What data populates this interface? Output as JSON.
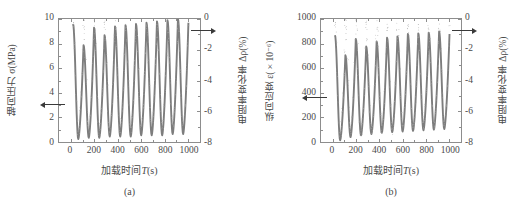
{
  "figure": {
    "panels": [
      {
        "id": "a",
        "panel_label": "(a)",
        "xtitle_cn": "加载时间",
        "xtitle_sym": "T",
        "xtitle_unit": "(s)",
        "ytitle_left": "轴向压力 σ(MPa)",
        "ytitle_right": "电阻率变化率 Δρ(%)",
        "xticks": [
          "0",
          "200",
          "400",
          "600",
          "800",
          "1000"
        ],
        "yticks_left": [
          "10",
          "8",
          "6",
          "4",
          "2",
          "0"
        ],
        "yticks_right": [
          "0",
          "-2",
          "-4",
          "-6",
          "-8"
        ]
      },
      {
        "id": "b",
        "panel_label": "(b)",
        "xtitle_cn": "加载时间",
        "xtitle_sym": "T",
        "xtitle_unit": "(s)",
        "ytitle_left": "纵向应变 ε(×10⁻⁶)",
        "ytitle_right": "电阻率变化率 Δρ(%)",
        "xticks": [
          "0",
          "200",
          "400",
          "600",
          "800",
          "1000"
        ],
        "yticks_left": [
          "1000",
          "800",
          "600",
          "400",
          "200",
          "0"
        ],
        "yticks_right": [
          "0",
          "-2",
          "-4",
          "-6",
          "-8"
        ]
      }
    ],
    "colors": {
      "axis": "#8d8d8d",
      "text": "#4a4a4a",
      "series_primary": "#7d7d7d",
      "series_secondary": "#a8a8a8",
      "arrow": "#3a3a3a"
    }
  },
  "chart_data": [
    {
      "type": "line",
      "title": "",
      "panel": "(a)",
      "xlabel": "加载时间 T(s)",
      "ylabel": "轴向压力 σ(MPa)",
      "ylabel_secondary": "电阻率变化率 Δρ(%)",
      "xlim": [
        -100,
        1100
      ],
      "ylim": [
        0,
        10
      ],
      "ylim_secondary": [
        -8,
        0
      ],
      "grid": false,
      "legend": "none",
      "annotations": [
        {
          "text": "left-arrow to axial stress axis",
          "axis": "left",
          "value": 1.8
        },
        {
          "text": "right-arrow to resistivity axis",
          "axis": "right",
          "value": -0.3
        }
      ],
      "cycles": 11,
      "cycle_period_s": 88,
      "series": [
        {
          "name": "轴向压力 σ(MPa)",
          "axis": "left",
          "marker": "solid-thick-line",
          "peak_values": [
            9.6,
            7.9,
            9.3,
            8.7,
            9.4,
            9.5,
            9.6,
            9.7,
            9.8,
            9.9,
            10.0,
            9.7
          ],
          "valley_values": [
            0.4,
            0.5,
            0.5,
            0.6,
            0.6,
            0.6,
            0.7,
            0.7,
            0.7,
            0.8,
            0.8
          ],
          "waveform": "quasi-sinusoidal cyclic loading, sharp peaks, rounded valleys"
        },
        {
          "name": "电阻率变化率 Δρ(%)",
          "axis": "right",
          "marker": "dotted-scatter",
          "peak_values": [
            -0.2,
            -0.3,
            -0.3,
            -0.4,
            -0.4,
            -0.5,
            -0.5,
            -0.5,
            -0.6,
            -0.6,
            -0.6
          ],
          "valley_values": [
            -7.4,
            -7.2,
            -7.3,
            -7.1,
            -7.1,
            -7.0,
            -7.0,
            -6.9,
            -6.9,
            -6.8,
            -6.8
          ],
          "waveform": "inverted cyclic response, scattered dotted envelope"
        }
      ]
    },
    {
      "type": "line",
      "title": "",
      "panel": "(b)",
      "xlabel": "加载时间 T(s)",
      "ylabel": "纵向应变 ε(×10⁻⁶)",
      "ylabel_secondary": "电阻率变化率 Δρ(%)",
      "xlim": [
        -100,
        1100
      ],
      "ylim": [
        0,
        1000
      ],
      "ylim_secondary": [
        -8,
        0
      ],
      "grid": false,
      "legend": "none",
      "annotations": [
        {
          "text": "left-arrow to longitudinal strain axis",
          "axis": "left",
          "value": 180
        },
        {
          "text": "right-arrow to resistivity axis",
          "axis": "right",
          "value": -0.3
        }
      ],
      "cycles": 11,
      "cycle_period_s": 88,
      "series": [
        {
          "name": "纵向应变 ε(×10⁻⁶)",
          "axis": "left",
          "marker": "solid-thick-line",
          "peak_values": [
            870,
            710,
            840,
            780,
            820,
            850,
            860,
            880,
            885,
            890,
            900,
            880
          ],
          "valley_values": [
            30,
            55,
            70,
            80,
            90,
            95,
            100,
            105,
            110,
            115,
            120
          ],
          "waveform": "quasi-sinusoidal cyclic strain, sharp peaks, rounded valleys"
        },
        {
          "name": "电阻率变化率 Δρ(%)",
          "axis": "right",
          "marker": "dotted-scatter",
          "peak_values": [
            -0.2,
            -0.3,
            -0.3,
            -0.4,
            -0.4,
            -0.5,
            -0.5,
            -0.5,
            -0.6,
            -0.6,
            -0.6
          ],
          "valley_values": [
            -7.5,
            -7.3,
            -7.3,
            -7.2,
            -7.1,
            -7.1,
            -7.0,
            -7.0,
            -6.9,
            -6.9,
            -6.8
          ],
          "waveform": "inverted cyclic response, scattered dotted envelope"
        }
      ]
    }
  ]
}
